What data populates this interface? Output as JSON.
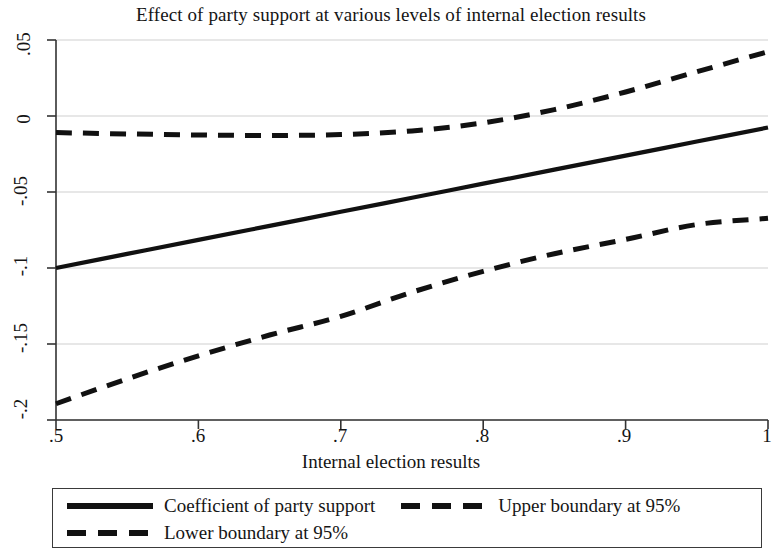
{
  "chart_data": {
    "type": "line",
    "title": "Effect of party support at various levels of internal election results",
    "xlabel": "Internal election results",
    "ylabel": "",
    "xlim": [
      0.5,
      1.0
    ],
    "ylim": [
      -0.2,
      0.05
    ],
    "grid": true,
    "xticks": [
      0.5,
      0.6,
      0.7,
      0.8,
      0.9,
      1
    ],
    "xtick_labels": [
      ".5",
      ".6",
      ".7",
      ".8",
      ".9",
      "1"
    ],
    "yticks": [
      0.05,
      0,
      -0.05,
      -0.1,
      -0.15,
      -0.2
    ],
    "ytick_labels": [
      ".05",
      "0",
      "-.05",
      "-.1",
      "-.15",
      "-.2"
    ],
    "legend_position": "below-plot",
    "series": [
      {
        "name": "Coefficient of party support",
        "style": "solid",
        "color": "#111111",
        "x": [
          0.5,
          0.55,
          0.6,
          0.65,
          0.7,
          0.75,
          0.8,
          0.85,
          0.9,
          0.95,
          1
        ],
        "values": [
          -0.1,
          -0.0907,
          -0.0815,
          -0.0723,
          -0.063,
          -0.0538,
          -0.0445,
          -0.0353,
          -0.0261,
          -0.0168,
          -0.0076
        ]
      },
      {
        "name": "Upper boundary at 95%",
        "style": "dashed",
        "color": "#111111",
        "x": [
          0.5,
          0.55,
          0.6,
          0.65,
          0.7,
          0.75,
          0.8,
          0.85,
          0.9,
          0.95,
          1
        ],
        "values": [
          -0.0109,
          -0.0118,
          -0.0125,
          -0.0128,
          -0.0122,
          -0.0098,
          -0.0045,
          0.0042,
          0.0158,
          0.0291,
          0.0423
        ]
      },
      {
        "name": "Lower boundary at 95%",
        "style": "dashed",
        "color": "#111111",
        "x": [
          0.5,
          0.55,
          0.6,
          0.65,
          0.7,
          0.75,
          0.8,
          0.85,
          0.9,
          0.95,
          1
        ],
        "values": [
          -0.1893,
          -0.1729,
          -0.1578,
          -0.1441,
          -0.1318,
          -0.1159,
          -0.1022,
          -0.0906,
          -0.0812,
          -0.0714,
          -0.0673
        ]
      }
    ]
  },
  "title": "Effect of party support at various levels of internal election results",
  "axes": {
    "x_axis_title": "Internal election results",
    "x_tick_labels": [
      ".5",
      ".6",
      ".7",
      ".8",
      ".9",
      "1"
    ],
    "y_tick_labels": [
      ".05",
      "0",
      "-.05",
      "-.1",
      "-.15",
      "-.2"
    ]
  },
  "legend": {
    "entries": [
      {
        "label": "Coefficient of party support",
        "style": "solid"
      },
      {
        "label": "Upper boundary at 95%",
        "style": "dashed"
      },
      {
        "label": "Lower boundary at 95%",
        "style": "dashed"
      }
    ]
  }
}
